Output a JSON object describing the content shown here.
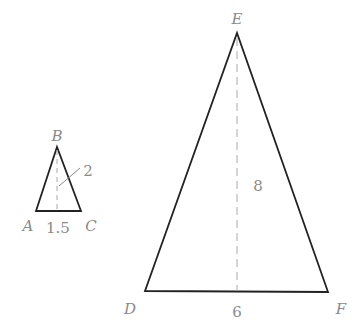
{
  "diagram": {
    "type": "similar-triangles",
    "stroke_color": "#222222",
    "label_color": "#8a8a8a",
    "dash_color": "#aaaaaa",
    "small_triangle": {
      "vertices": {
        "A": {
          "label": "A",
          "x": 36,
          "y": 211
        },
        "B": {
          "label": "B",
          "x": 57,
          "y": 147
        },
        "C": {
          "label": "C",
          "x": 81,
          "y": 211
        }
      },
      "base_label": "1.5",
      "height_label": "2"
    },
    "large_triangle": {
      "vertices": {
        "D": {
          "label": "D",
          "x": 145,
          "y": 291
        },
        "E": {
          "label": "E",
          "x": 237,
          "y": 33
        },
        "F": {
          "label": "F",
          "x": 328,
          "y": 292
        }
      },
      "base_label": "6",
      "height_label": "8"
    }
  }
}
